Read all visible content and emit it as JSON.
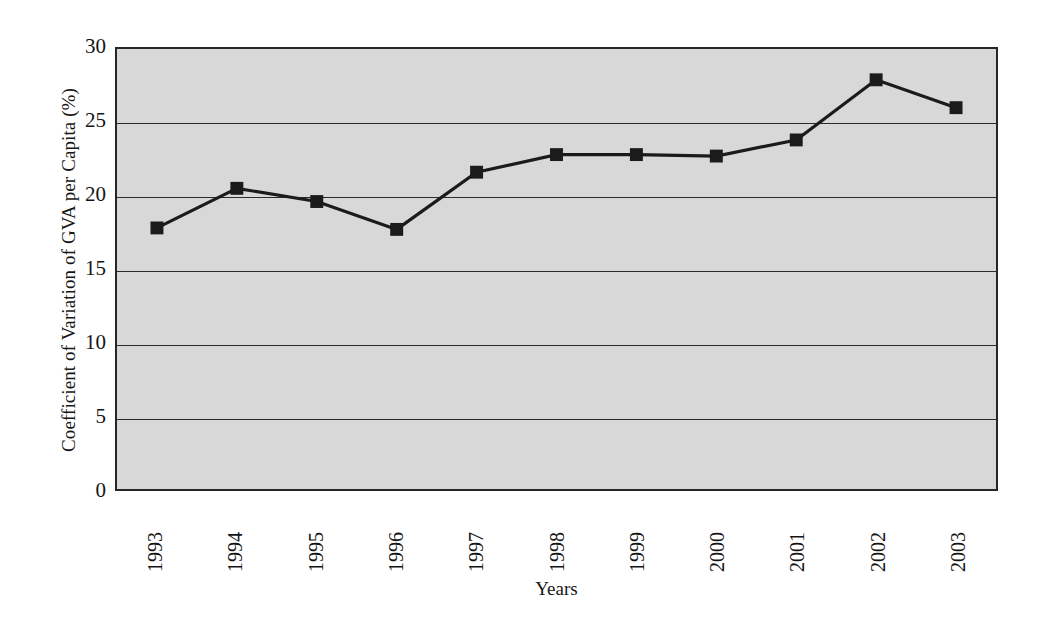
{
  "chart_data": {
    "type": "line",
    "title": "",
    "xlabel": "Years",
    "ylabel": "Coefficient of Variation of GVA per Capita (%)",
    "categories": [
      "1993",
      "1994",
      "1995",
      "1996",
      "1997",
      "1998",
      "1999",
      "2000",
      "2001",
      "2002",
      "2003"
    ],
    "values": [
      17.8,
      20.5,
      19.6,
      17.7,
      21.6,
      22.8,
      22.8,
      22.7,
      23.8,
      27.9,
      26.0
    ],
    "series": [
      {
        "name": "Coefficient of Variation of GVA per Capita",
        "values": [
          17.8,
          20.5,
          19.6,
          17.7,
          21.6,
          22.8,
          22.8,
          22.7,
          23.8,
          27.9,
          26.0
        ]
      }
    ],
    "ylim": [
      0,
      30
    ],
    "y_ticks": [
      0,
      5,
      10,
      15,
      20,
      25,
      30
    ],
    "y_tick_labels": [
      "0",
      "5",
      "10",
      "15",
      "20",
      "25",
      "30"
    ],
    "gridlines": [
      5,
      10,
      15,
      20,
      25
    ],
    "grid": true,
    "legend": "none",
    "marker": "square",
    "line_color": "#1b1b1b",
    "marker_color": "#1b1b1b",
    "plot_background": "#d8d8d8",
    "figure_background": "#ffffff",
    "x_tick_rotation": 90
  }
}
